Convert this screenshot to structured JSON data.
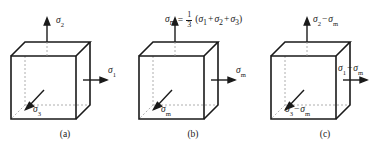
{
  "figure": {
    "colors": {
      "line": "#1a1a1a",
      "hidden_line": "#9a9a9a",
      "background": "#ffffff"
    },
    "panels": [
      {
        "id": "a",
        "caption": "(a)",
        "cube": {
          "name": "stress-cube"
        },
        "arrows": [
          {
            "name": "arrow-sigma2-up",
            "direction": "up",
            "label": {
              "base": "σ",
              "sub": "2",
              "sub_style": "italic",
              "text": "σ2"
            }
          },
          {
            "name": "arrow-sigma1-right",
            "direction": "right",
            "label": {
              "base": "σ",
              "sub": "1",
              "sub_style": "italic",
              "text": "σ1"
            }
          },
          {
            "name": "arrow-sigma3-down-left",
            "direction": "down-left",
            "label": {
              "base": "σ",
              "sub": "3",
              "sub_style": "italic",
              "text": "σ3"
            }
          }
        ]
      },
      {
        "id": "b",
        "caption": "(b)",
        "cube": {
          "name": "stress-cube"
        },
        "formula": {
          "name": "mean-stress-formula",
          "lhs_base": "σ",
          "lhs_sub": "m",
          "equals": "=",
          "numerator": "1",
          "denominator": "3",
          "open_paren": "(",
          "term1_base": "σ",
          "term1_sub": "1",
          "plus1": "+",
          "term2_base": "σ",
          "term2_sub": "2",
          "plus2": "+",
          "term3_base": "σ",
          "term3_sub": "3",
          "close_paren": ")",
          "plain": "σm = 1/3 (σ1 + σ2 + σ3)"
        },
        "arrows": [
          {
            "name": "arrow-sigma-m-up",
            "direction": "up",
            "label": {
              "base": "",
              "sub": "",
              "sub_style": "roman",
              "text": ""
            }
          },
          {
            "name": "arrow-sigma-m-right",
            "direction": "right",
            "label": {
              "base": "σ",
              "sub": "m",
              "sub_style": "roman",
              "text": "σm"
            }
          },
          {
            "name": "arrow-sigma-m-down-left",
            "direction": "down-left",
            "label": {
              "base": "σ",
              "sub": "m",
              "sub_style": "roman",
              "text": "σm"
            }
          }
        ]
      },
      {
        "id": "c",
        "caption": "(c)",
        "cube": {
          "name": "stress-cube"
        },
        "arrows": [
          {
            "name": "arrow-sigma2-minus-sigmam-up",
            "direction": "up",
            "label": {
              "base": "σ",
              "sub": "2",
              "sub_style": "italic",
              "minus": "−",
              "base2": "σ",
              "sub2": "m",
              "text": "σ2 − σm"
            }
          },
          {
            "name": "arrow-sigma1-minus-sigmam-right",
            "direction": "right",
            "label": {
              "base": "σ",
              "sub": "1",
              "sub_style": "italic",
              "minus": "−",
              "base2": "σ",
              "sub2": "m",
              "text": "σ1 − σm"
            }
          },
          {
            "name": "arrow-sigma3-minus-sigmam-down-left",
            "direction": "down-left",
            "label": {
              "base": "σ",
              "sub": "3",
              "sub_style": "italic",
              "minus": "−",
              "base2": "σ",
              "sub2": "m",
              "text": "σ3 − σm"
            }
          }
        ]
      }
    ]
  }
}
